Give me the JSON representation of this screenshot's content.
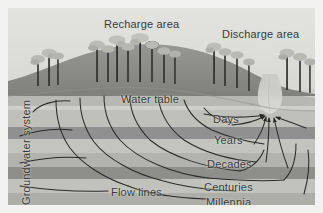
{
  "figure": {
    "width": 323,
    "height": 213,
    "background_color": "#f2f2f0"
  },
  "labels": {
    "recharge_area": "Recharge area",
    "discharge_area": "Discharge area",
    "water_table": "Water table",
    "flow_lines": "Flow lines",
    "groundwater_system": "Groundwater system"
  },
  "travel_times": [
    {
      "name": "days",
      "label": "Days"
    },
    {
      "name": "years",
      "label": "Years"
    },
    {
      "name": "decades",
      "label": "Decades"
    },
    {
      "name": "centuries",
      "label": "Centuries"
    },
    {
      "name": "millennia",
      "label": "Millennia"
    }
  ],
  "colors": {
    "sky": "#dcdcd8",
    "hill_upper": "#8d8d8a",
    "hill_lower": "#a6a6a2",
    "unsaturated_zone": "#cfcfca",
    "aquifer_light": "#c6c6c1",
    "aquifer_mid": "#b6b6b1",
    "aquitard_dark": "#8f8f8b",
    "deep_layer": "#a9a9a4",
    "stream": "#d4d4cf",
    "tree_canopy": "#b3b3ae",
    "tree_trunk": "#2f2f2d",
    "flow_line": "#2e2e2c",
    "text": "#3a3a38"
  },
  "elements": {
    "tree_count": 18,
    "flow_line_count": 9,
    "arrow_count": 6,
    "stream_present": true
  }
}
